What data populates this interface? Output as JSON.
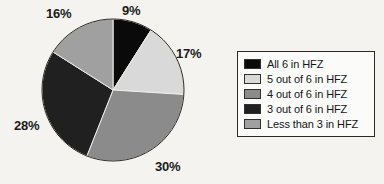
{
  "chart_data": {
    "type": "pie",
    "title": "",
    "subtitle": "",
    "xlabel": "",
    "ylabel": "",
    "grid": false,
    "legend_position": "right",
    "start_angle_deg": 0,
    "direction": "clockwise",
    "categories": [
      "All 6 in HFZ",
      "5 out of 6 in HFZ",
      "4 out of 6 in HFZ",
      "3 out of 6 in HFZ",
      "Less than 3 in HFZ"
    ],
    "values": [
      9,
      17,
      30,
      28,
      16
    ],
    "value_labels": [
      "9%",
      "17%",
      "30%",
      "28%",
      "16%"
    ],
    "colors": [
      "#0a0a0a",
      "#d9d9d9",
      "#8b8b8b",
      "#202020",
      "#a0a0a0"
    ],
    "units": "percent"
  },
  "legend": {
    "items": [
      {
        "label": "All 6 in HFZ",
        "color": "#0a0a0a"
      },
      {
        "label": "5 out of 6 in HFZ",
        "color": "#d9d9d9"
      },
      {
        "label": "4 out of 6 in HFZ",
        "color": "#8b8b8b"
      },
      {
        "label": "3 out of 6 in HFZ",
        "color": "#202020"
      },
      {
        "label": "Less than 3 in HFZ",
        "color": "#a0a0a0"
      }
    ]
  },
  "geometry": {
    "center_x": 113,
    "center_y": 90,
    "radius": 71
  }
}
